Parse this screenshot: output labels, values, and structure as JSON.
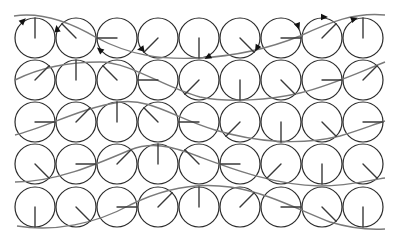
{
  "diagram": {
    "grid": {
      "rows": 5,
      "cols": 9,
      "radius": 20,
      "col_x": [
        35,
        76,
        117,
        158,
        199,
        240,
        281,
        322,
        363
      ],
      "row_y": [
        38,
        80,
        122,
        164,
        207
      ]
    },
    "hand_angles_deg": [
      [
        90,
        135,
        180,
        225,
        270,
        315,
        0,
        45,
        90
      ],
      [
        45,
        90,
        135,
        180,
        225,
        270,
        315,
        0,
        45
      ],
      [
        0,
        45,
        90,
        135,
        180,
        225,
        270,
        315,
        0
      ],
      [
        315,
        0,
        45,
        90,
        135,
        180,
        225,
        270,
        315
      ],
      [
        270,
        315,
        0,
        45,
        90,
        45,
        0,
        315,
        270
      ]
    ],
    "waves": [
      "M14,16 C40,12 70,22 97,38 C130,55 160,60 199,58 C240,56 275,46 300,36 C330,22 355,12 385,15",
      "M15,80 C35,70 60,62 100,62 C130,62 165,88 200,97 C230,103 270,100 300,93 C330,86 360,72 385,62",
      "M15,135 C45,128 80,108 120,102 C150,98 175,118 215,130 C255,142 300,146 340,136 C360,130 375,124 385,121",
      "M15,182 C55,182 95,165 130,150 C150,142 170,145 200,157 C235,170 275,185 320,186 C350,186 370,180 385,178",
      "M17,226 C55,232 95,224 130,205 C160,190 195,182 230,187 C265,192 295,208 330,222 C350,228 370,230 385,229"
    ],
    "arrows": [
      {
        "x": 23,
        "y": 21,
        "angle": -45
      },
      {
        "x": 57,
        "y": 29,
        "angle": -100
      },
      {
        "x": 100,
        "y": 50,
        "angle": -140
      },
      {
        "x": 141,
        "y": 49,
        "angle": 170
      },
      {
        "x": 208,
        "y": 57,
        "angle": 150
      },
      {
        "x": 257,
        "y": 48,
        "angle": 120
      },
      {
        "x": 298,
        "y": 26,
        "angle": 70
      },
      {
        "x": 324,
        "y": 17,
        "angle": 0
      },
      {
        "x": 354,
        "y": 19,
        "angle": -20
      }
    ]
  }
}
